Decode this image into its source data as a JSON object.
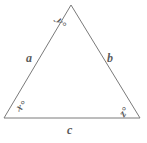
{
  "figure": {
    "type": "triangle-diagram",
    "background_color": "#ffffff",
    "stroke_color": "#7a7a7a",
    "label_color": "#5c5c5c",
    "stroke_width": 1,
    "vertices": {
      "apex": {
        "x": 71,
        "y": 5
      },
      "bottom_left": {
        "x": 4,
        "y": 118
      },
      "bottom_right": {
        "x": 140,
        "y": 118
      }
    },
    "angle_labels": {
      "apex": "y°",
      "bottom_left": "x°",
      "bottom_right": "z°"
    },
    "side_labels": {
      "left": "a",
      "right": "b",
      "bottom": "c"
    }
  }
}
